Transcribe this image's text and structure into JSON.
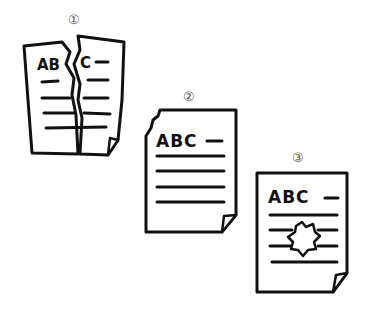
{
  "figures": [
    {
      "label": "①",
      "text": "ABC",
      "description": "torn document"
    },
    {
      "label": "②",
      "text": "ABC",
      "description": "document with torn corner"
    },
    {
      "label": "③",
      "text": "ABC",
      "description": "document with hole"
    }
  ]
}
